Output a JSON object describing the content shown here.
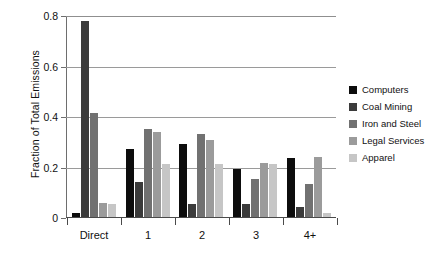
{
  "chart_data": {
    "type": "bar",
    "title": "",
    "xlabel": "",
    "ylabel": "Fraction of Total Emissions",
    "categories": [
      "Direct",
      "1",
      "2",
      "3",
      "4+"
    ],
    "ylim": [
      0,
      0.8
    ],
    "yticks": [
      "0",
      "0.2",
      "0.4",
      "0.6",
      "0.8"
    ],
    "ytick_values": [
      0,
      0.2,
      0.4,
      0.6,
      0.8
    ],
    "grid": true,
    "legend_position": "right",
    "series": [
      {
        "name": "Computers",
        "color": "#0d0d0d",
        "values": [
          0.015,
          0.27,
          0.29,
          0.19,
          0.235
        ]
      },
      {
        "name": "Coal Mining",
        "color": "#3b3b3b",
        "values": [
          0.78,
          0.14,
          0.05,
          0.05,
          0.04
        ]
      },
      {
        "name": "Iron and Steel",
        "color": "#717171",
        "values": [
          0.415,
          0.35,
          0.33,
          0.15,
          0.13
        ]
      },
      {
        "name": "Legal Services",
        "color": "#9b9b9b",
        "values": [
          0.055,
          0.34,
          0.305,
          0.215,
          0.24
        ]
      },
      {
        "name": "Apparel",
        "color": "#c6c6c6",
        "values": [
          0.05,
          0.21,
          0.21,
          0.21,
          0.015
        ]
      }
    ]
  },
  "axes": {
    "y_title": "Fraction of Total Emissions"
  }
}
